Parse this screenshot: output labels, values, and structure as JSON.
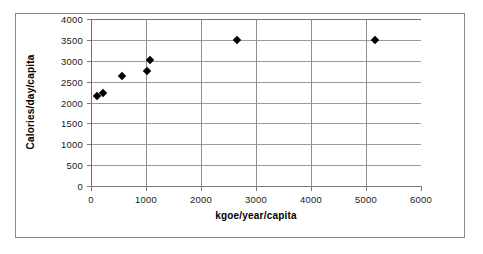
{
  "chart_data": {
    "type": "scatter",
    "title": "",
    "xlabel": "kgoe/year/capita",
    "ylabel": "Calories/day/capita",
    "xlim": [
      0,
      6000
    ],
    "ylim": [
      0,
      4000
    ],
    "xticks": [
      0,
      1000,
      2000,
      3000,
      4000,
      5000,
      6000
    ],
    "yticks": [
      0,
      500,
      1000,
      1500,
      2000,
      2500,
      3000,
      3500,
      4000
    ],
    "xtick_labels": [
      "0",
      "1000",
      "2000",
      "3000",
      "4000",
      "5000",
      "6000"
    ],
    "ytick_labels": [
      "0",
      "500",
      "1000",
      "1500",
      "2000",
      "2500",
      "3000",
      "3500",
      "4000"
    ],
    "grid": {
      "horizontal": true,
      "vertical": true
    },
    "legend": null,
    "marker": {
      "shape": "diamond",
      "color": "#000000",
      "size": 6
    },
    "series": [
      {
        "name": "Energy vs food consumption",
        "points": [
          {
            "x": 110,
            "y": 2150
          },
          {
            "x": 220,
            "y": 2220
          },
          {
            "x": 560,
            "y": 2640
          },
          {
            "x": 1010,
            "y": 2750
          },
          {
            "x": 1080,
            "y": 3020
          },
          {
            "x": 2650,
            "y": 3490
          },
          {
            "x": 5160,
            "y": 3500
          }
        ]
      }
    ]
  }
}
